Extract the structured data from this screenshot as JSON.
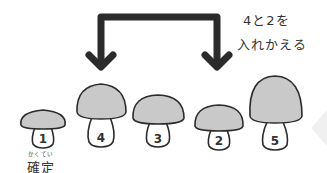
{
  "instruction": {
    "line1": "4と2を",
    "line2": "入れかえる"
  },
  "confirmed": {
    "ruby": "かくてい",
    "label": "確定"
  },
  "mushrooms": [
    {
      "label": "1",
      "state": "confirmed"
    },
    {
      "label": "4",
      "state": "swap"
    },
    {
      "label": "3",
      "state": "unsorted"
    },
    {
      "label": "2",
      "state": "swap"
    },
    {
      "label": "5",
      "state": "unsorted"
    }
  ],
  "swap_pair": [
    "4",
    "2"
  ],
  "colors": {
    "cap_fill": "#c9c9c9",
    "stem_fill": "#ffffff",
    "outline": "#2b2b2b",
    "arrow": "#2b2b2b",
    "text": "#333333"
  }
}
